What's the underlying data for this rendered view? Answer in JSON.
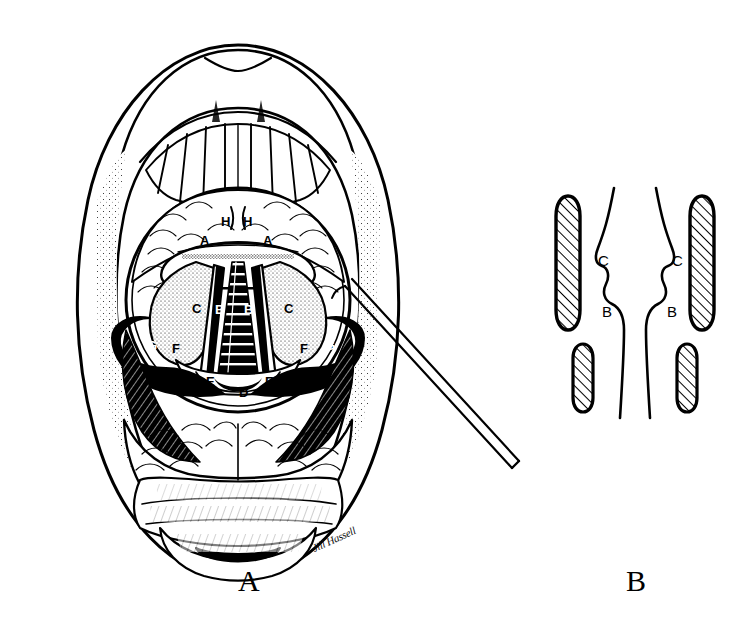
{
  "figure": {
    "background_color": "#ffffff",
    "ink_color": "#000000"
  },
  "panels": [
    {
      "id": "A",
      "caption": "A",
      "caption_x": 238,
      "caption_y": 566,
      "description": "Open mouth, indirect laryngoscopy view with mirror image of larynx"
    },
    {
      "id": "B",
      "caption": "B",
      "caption_x": 626,
      "caption_y": 566,
      "description": "Coronal schematic of laryngeal lumen with cartilages"
    }
  ],
  "panel_a_labels": [
    {
      "text": "H",
      "x": 221,
      "y": 215,
      "inverted": false,
      "name": "label-h-left"
    },
    {
      "text": "H",
      "x": 243,
      "y": 215,
      "inverted": false,
      "name": "label-h-right"
    },
    {
      "text": "A",
      "x": 200,
      "y": 234,
      "inverted": false,
      "name": "label-a-left"
    },
    {
      "text": "A",
      "x": 263,
      "y": 234,
      "inverted": false,
      "name": "label-a-right"
    },
    {
      "text": "C",
      "x": 192,
      "y": 302,
      "inverted": false,
      "name": "label-c-left"
    },
    {
      "text": "B",
      "x": 215,
      "y": 303,
      "inverted": true,
      "name": "label-b-left"
    },
    {
      "text": "B",
      "x": 244,
      "y": 303,
      "inverted": true,
      "name": "label-b-right"
    },
    {
      "text": "C",
      "x": 284,
      "y": 302,
      "inverted": false,
      "name": "label-c-right"
    },
    {
      "text": "G",
      "x": 147,
      "y": 339,
      "inverted": true,
      "name": "label-g-left"
    },
    {
      "text": "F",
      "x": 172,
      "y": 342,
      "inverted": false,
      "name": "label-f-left"
    },
    {
      "text": "F",
      "x": 300,
      "y": 342,
      "inverted": false,
      "name": "label-f-right"
    },
    {
      "text": "G",
      "x": 325,
      "y": 339,
      "inverted": true,
      "name": "label-g-right"
    },
    {
      "text": "E",
      "x": 206,
      "y": 375,
      "inverted": false,
      "name": "label-e-left"
    },
    {
      "text": "D",
      "x": 239,
      "y": 386,
      "inverted": false,
      "name": "label-d-center"
    },
    {
      "text": "E",
      "x": 265,
      "y": 375,
      "inverted": false,
      "name": "label-e-right"
    }
  ],
  "panel_b_labels": [
    {
      "text": "C",
      "x": 598,
      "y": 253,
      "name": "label-c-left-coronal"
    },
    {
      "text": "C",
      "x": 672,
      "y": 253,
      "name": "label-c-right-coronal"
    },
    {
      "text": "B",
      "x": 602,
      "y": 304,
      "name": "label-b-left-coronal"
    },
    {
      "text": "B",
      "x": 667,
      "y": 304,
      "name": "label-b-right-coronal"
    }
  ],
  "signature": {
    "text": "Jill Hassell",
    "x": 315,
    "y": 542
  },
  "instrument": {
    "name": "laryngeal-mirror-probe",
    "label": ""
  }
}
